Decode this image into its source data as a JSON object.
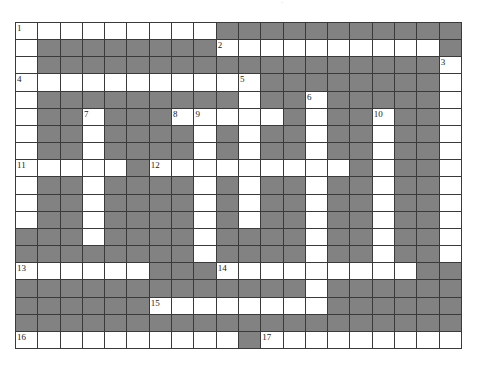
{
  "puzzle": {
    "rows": 19,
    "cols": 20,
    "colors": {
      "white": "#ffffff",
      "block": "#828282",
      "line": "#3a3a3a",
      "number": "#222222"
    },
    "layout": [
      "WWWWWWWWWGGGGGGGGGGG",
      "WGGGGGGGGWWWWWWWWWWG",
      "WGGGGGGGGGGGGGGGGGGW",
      "WWWWWWWWWWWGGGGGGGGW",
      "WGGGGGGGGGWGGWGGGGGW",
      "WGGWGGGWWWWWGWGGWGGW",
      "WGGWGGGGWGWGGWGGWGGW",
      "WGGWGGGGWGWGGWGGWGGW",
      "WWWWWGWWWWWWWWWGWGGW",
      "WGGWGGGGWGWGGWGGWGGW",
      "WGGWGGGGWGWGGWGGWGGW",
      "WGGWGGGGWGWGGWGGWGGW",
      "GGGWGGGGWGGGGWGGWGGW",
      "GGGGGGGGWGGGGWGGWGGW",
      "WWWWWWGGGWWWWWWWWWGG",
      "GGGGGGGGGGGGGWGGGGGG",
      "GGGGGGWWWWWWWWGGGGGG",
      "GGGGGGGGGGGGGGGGGGGG",
      "WWWWWWWWWWGWWWWWWWWW"
    ],
    "numbers": [
      {
        "row": 0,
        "col": 0,
        "label": "1"
      },
      {
        "row": 1,
        "col": 9,
        "label": "2"
      },
      {
        "row": 2,
        "col": 19,
        "label": "3"
      },
      {
        "row": 3,
        "col": 0,
        "label": "4"
      },
      {
        "row": 3,
        "col": 10,
        "label": "5"
      },
      {
        "row": 4,
        "col": 13,
        "label": "6"
      },
      {
        "row": 5,
        "col": 3,
        "label": "7"
      },
      {
        "row": 5,
        "col": 7,
        "label": "8"
      },
      {
        "row": 5,
        "col": 8,
        "label": "9"
      },
      {
        "row": 5,
        "col": 16,
        "label": "10"
      },
      {
        "row": 8,
        "col": 0,
        "label": "11"
      },
      {
        "row": 8,
        "col": 6,
        "label": "12"
      },
      {
        "row": 14,
        "col": 0,
        "label": "13"
      },
      {
        "row": 14,
        "col": 9,
        "label": "14"
      },
      {
        "row": 16,
        "col": 6,
        "label": "15"
      },
      {
        "row": 18,
        "col": 0,
        "label": "16"
      },
      {
        "row": 18,
        "col": 11,
        "label": "17"
      }
    ]
  },
  "top_mark": "·"
}
